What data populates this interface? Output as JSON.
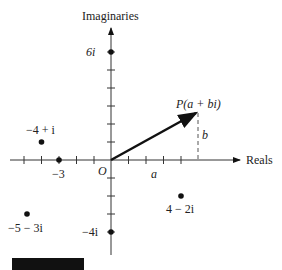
{
  "diagram": {
    "type": "complex-plane",
    "axis_labels": {
      "vertical": "Imaginaries",
      "horizontal": "Reals"
    },
    "origin_label": "O",
    "points": [
      {
        "label": "6i",
        "re": 0,
        "im": 6
      },
      {
        "label": "−4 + i",
        "re": -4,
        "im": 1
      },
      {
        "label": "−3",
        "re": -3,
        "im": 0
      },
      {
        "label": "−5 − 3i",
        "re": -5,
        "im": -3
      },
      {
        "label": "−4i",
        "re": 0,
        "im": -4
      },
      {
        "label": "4 − 2i",
        "re": 4,
        "im": -2
      }
    ],
    "vector": {
      "label": "P(a + bi)",
      "re": 5,
      "im": 3,
      "component_labels": {
        "horizontal": "a",
        "vertical": "b"
      }
    },
    "colors": {
      "ink": "#111111",
      "background": "#ffffff"
    }
  }
}
